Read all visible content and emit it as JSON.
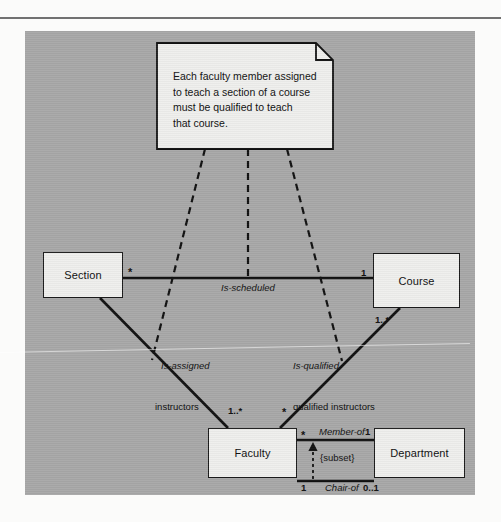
{
  "page": {
    "ghost_top": "",
    "ghost_bottom": ""
  },
  "note": {
    "name": "constraint-note",
    "text": "Each faculty member assigned\nto teach a section of a course\nmust be qualified to teach\nthat course."
  },
  "classes": [
    {
      "id": "section",
      "name": "Section"
    },
    {
      "id": "course",
      "name": "Course"
    },
    {
      "id": "faculty",
      "name": "Faculty"
    },
    {
      "id": "department",
      "name": "Department"
    }
  ],
  "associations": [
    {
      "id": "is-scheduled",
      "label": "Is-scheduled",
      "from": "Section",
      "to": "Course",
      "from_multiplicity": "*",
      "to_multiplicity": "1"
    },
    {
      "id": "is-assigned",
      "label": "Is-assigned",
      "from": "Section",
      "to": "Faculty",
      "from_multiplicity": "*",
      "to_multiplicity": "1..*",
      "role": "instructors"
    },
    {
      "id": "is-qualified",
      "label": "Is-qualified",
      "from": "Course",
      "to": "Faculty",
      "from_multiplicity": "1..*",
      "to_multiplicity": "*",
      "role": "qualified instructors"
    },
    {
      "id": "member-of",
      "label": "Member-of",
      "from": "Faculty",
      "to": "Department",
      "from_multiplicity": "*",
      "to_multiplicity": "1"
    },
    {
      "id": "chair-of",
      "label": "Chair-of",
      "from": "Faculty",
      "to": "Department",
      "from_multiplicity": "1",
      "to_multiplicity": "0..1"
    }
  ],
  "constraints": [
    {
      "id": "subset",
      "label": "{subset}"
    }
  ],
  "colors": {
    "panel_background": "#a8a8a8",
    "box_fill": "#efefed",
    "line": "#111111",
    "page_background": "#fbfbfa"
  }
}
